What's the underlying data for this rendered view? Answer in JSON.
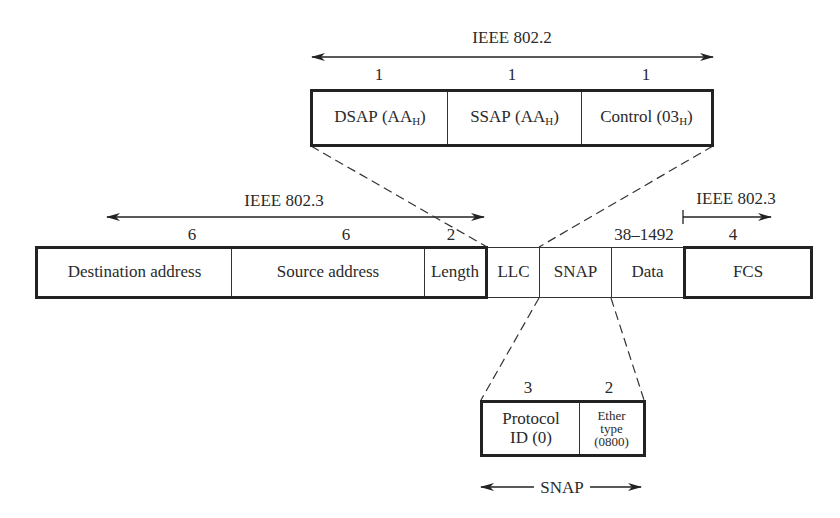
{
  "llc_header": {
    "label": "IEEE 802.2",
    "fields": [
      {
        "size": "1",
        "name": "DSAP",
        "value_prefix": "(AA",
        "sub": "H",
        "value_suffix": ")"
      },
      {
        "size": "1",
        "name": "SSAP",
        "value_prefix": "(AA",
        "sub": "H",
        "value_suffix": ")"
      },
      {
        "size": "1",
        "name": "Control",
        "value_prefix": "(03",
        "sub": "H",
        "value_suffix": ")"
      }
    ]
  },
  "frame": {
    "header_label": "IEEE 802.3",
    "trailer_label": "IEEE 802.3",
    "fields": [
      {
        "name": "Destination address",
        "size": "6"
      },
      {
        "name": "Source address",
        "size": "6"
      },
      {
        "name": "Length",
        "size": "2"
      },
      {
        "name": "LLC",
        "size": ""
      },
      {
        "name": "SNAP",
        "size": ""
      },
      {
        "name": "Data",
        "size": "38–1492"
      },
      {
        "name": "FCS",
        "size": "4"
      }
    ]
  },
  "snap_header": {
    "label": "SNAP",
    "fields": [
      {
        "size": "3",
        "line1": "Protocol",
        "line2": "ID (0)"
      },
      {
        "size": "2",
        "line1": "Ether",
        "line2": "type",
        "line3": "(0800)"
      }
    ]
  }
}
